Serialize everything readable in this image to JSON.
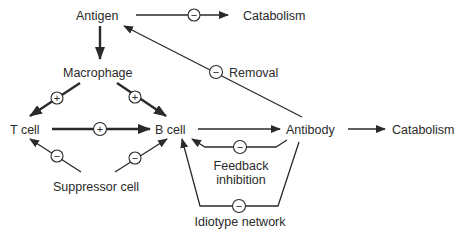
{
  "nodes": {
    "antigen": "Antigen",
    "catabolism_top": "Catabolism",
    "macrophage": "Macrophage",
    "removal": "Removal",
    "t_cell": "T cell",
    "b_cell": "B cell",
    "antibody": "Antibody",
    "catabolism_right": "Catabolism",
    "suppressor_cell": "Suppressor cell",
    "feedback_line1": "Feedback",
    "feedback_line2": "inhibition",
    "idiotype_network": "Idiotype network"
  },
  "signs": {
    "positive": "+",
    "negative": "−"
  },
  "edges": [
    {
      "from": "Antigen",
      "to": "Catabolism",
      "sign": "−"
    },
    {
      "from": "Antigen",
      "to": "Macrophage",
      "sign": ""
    },
    {
      "from": "Macrophage",
      "to": "T cell",
      "sign": "+"
    },
    {
      "from": "Macrophage",
      "to": "B cell",
      "sign": "+"
    },
    {
      "from": "T cell",
      "to": "B cell",
      "sign": "+"
    },
    {
      "from": "Suppressor cell",
      "to": "T cell",
      "sign": "−"
    },
    {
      "from": "Suppressor cell",
      "to": "B cell",
      "sign": "−"
    },
    {
      "from": "B cell",
      "to": "Antibody",
      "sign": ""
    },
    {
      "from": "Antibody",
      "to": "Catabolism",
      "sign": ""
    },
    {
      "from": "Antibody",
      "to": "Antigen",
      "sign": "−",
      "label": "Removal"
    },
    {
      "from": "Antibody",
      "to": "B cell",
      "sign": "−",
      "label": "Feedback inhibition"
    },
    {
      "from": "Antibody",
      "to": "B cell",
      "sign": "−",
      "label": "Idiotype network"
    }
  ],
  "colors": {
    "ink": "#2a2a2a",
    "background": "#ffffff"
  }
}
